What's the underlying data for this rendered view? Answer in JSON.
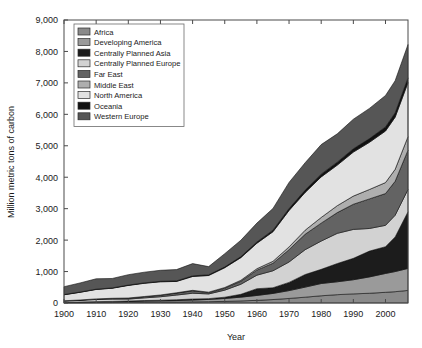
{
  "chart_data": {
    "type": "area",
    "stacked": true,
    "title": "",
    "xlabel": "Year",
    "ylabel": "Million metric tons of carbon",
    "xlim": [
      1900,
      2007
    ],
    "ylim": [
      0,
      9000
    ],
    "xticks": [
      1900,
      1910,
      1920,
      1930,
      1940,
      1950,
      1960,
      1970,
      1980,
      1990,
      2000
    ],
    "xtick_labels": [
      "1900",
      "1910",
      "1920",
      "1930",
      "1940",
      "1950",
      "1960",
      "1970",
      "1980",
      "1990",
      "2000"
    ],
    "yticks": [
      0,
      1000,
      2000,
      3000,
      4000,
      5000,
      6000,
      7000,
      8000,
      9000
    ],
    "ytick_labels": [
      "0",
      "1,000",
      "2,000",
      "3,000",
      "4,000",
      "5,000",
      "6,000",
      "7,000",
      "8,000",
      "9,000"
    ],
    "grid": false,
    "legend_position": "top-left",
    "x": [
      1900,
      1905,
      1910,
      1915,
      1920,
      1925,
      1930,
      1935,
      1940,
      1945,
      1950,
      1955,
      1960,
      1965,
      1970,
      1975,
      1980,
      1985,
      1990,
      1995,
      2000,
      2003,
      2007
    ],
    "series": [
      {
        "name": "Africa",
        "color": "#8a8a8a",
        "values": [
          8,
          10,
          13,
          15,
          19,
          23,
          26,
          30,
          36,
          42,
          52,
          66,
          85,
          110,
          145,
          185,
          230,
          265,
          290,
          310,
          340,
          360,
          400
        ]
      },
      {
        "name": "Developing America",
        "color": "#9a9a9a",
        "values": [
          10,
          14,
          20,
          24,
          30,
          38,
          42,
          48,
          58,
          72,
          92,
          120,
          155,
          195,
          250,
          320,
          390,
          410,
          450,
          520,
          600,
          640,
          700
        ]
      },
      {
        "name": "Centrally Planned Asia",
        "color": "#1c1c1c",
        "values": [
          5,
          7,
          10,
          12,
          14,
          17,
          21,
          25,
          32,
          25,
          40,
          90,
          215,
          180,
          260,
          400,
          450,
          580,
          680,
          820,
          850,
          1100,
          1800
        ]
      },
      {
        "name": "Centrally Planned Europe",
        "color": "#d2d2d2",
        "values": [
          40,
          52,
          68,
          72,
          62,
          85,
          110,
          150,
          185,
          150,
          225,
          320,
          430,
          540,
          650,
          790,
          900,
          960,
          920,
          720,
          680,
          690,
          710
        ]
      },
      {
        "name": "Far East",
        "color": "#636363",
        "values": [
          8,
          12,
          18,
          24,
          30,
          38,
          48,
          62,
          78,
          40,
          62,
          95,
          160,
          240,
          390,
          490,
          570,
          660,
          800,
          940,
          1010,
          1080,
          1250
        ]
      },
      {
        "name": "Middle East",
        "color": "#aeaeae",
        "values": [
          1,
          1,
          2,
          3,
          4,
          6,
          8,
          11,
          14,
          16,
          22,
          32,
          46,
          62,
          88,
          130,
          180,
          220,
          260,
          300,
          350,
          380,
          430
        ]
      },
      {
        "name": "North America",
        "color": "#e2e2e2",
        "values": [
          190,
          245,
          300,
          320,
          400,
          420,
          420,
          360,
          440,
          530,
          630,
          720,
          810,
          940,
          1160,
          1200,
          1290,
          1290,
          1400,
          1500,
          1640,
          1660,
          1720
        ]
      },
      {
        "name": "Oceania",
        "color": "#111111",
        "values": [
          6,
          7,
          9,
          10,
          11,
          13,
          15,
          17,
          20,
          22,
          26,
          32,
          40,
          50,
          62,
          75,
          88,
          95,
          105,
          118,
          130,
          138,
          150
        ]
      },
      {
        "name": "Western Europe",
        "color": "#565656",
        "values": [
          250,
          290,
          330,
          300,
          330,
          340,
          350,
          360,
          390,
          260,
          420,
          520,
          600,
          690,
          830,
          870,
          940,
          900,
          940,
          960,
          1000,
          1020,
          1060
        ]
      }
    ],
    "totals_note": "Peak total approximately 8,300 in final year",
    "legend_entries": [
      {
        "label": "Africa",
        "color": "#8a8a8a"
      },
      {
        "label": "Developing America",
        "color": "#9a9a9a"
      },
      {
        "label": "Centrally Planned Asia",
        "color": "#1c1c1c"
      },
      {
        "label": "Centrally Planned Europe",
        "color": "#d2d2d2"
      },
      {
        "label": "Far East",
        "color": "#636363"
      },
      {
        "label": "Middle East",
        "color": "#aeaeae"
      },
      {
        "label": "North America",
        "color": "#e2e2e2"
      },
      {
        "label": "Oceania",
        "color": "#111111"
      },
      {
        "label": "Western Europe",
        "color": "#565656"
      }
    ]
  },
  "plot": {
    "axis_color": "#4a4a4a",
    "background": "#ffffff"
  }
}
